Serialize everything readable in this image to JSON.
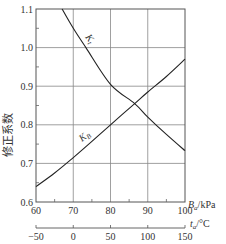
{
  "chart_data": {
    "type": "line",
    "title": "",
    "xlabel": "B_a/kPa",
    "xlabel_main": "B",
    "xlabel_sub": "a",
    "xlabel_unit": "/kPa",
    "ylabel": "修正系数",
    "xlim": [
      60,
      100
    ],
    "ylim": [
      0.6,
      1.1
    ],
    "x_ticks": [
      60,
      70,
      80,
      90,
      100
    ],
    "x_minor_ticks": [
      65,
      75,
      85,
      95
    ],
    "y_ticks": [
      0.6,
      0.7,
      0.8,
      0.9,
      1.0,
      1.1
    ],
    "y_tick_labels": [
      "0.6",
      "0.7",
      "0.8",
      "0.9",
      "1.0",
      "1.1"
    ],
    "y_minor_ticks": [
      0.65,
      0.75,
      0.85,
      0.95,
      1.05
    ],
    "grid": true,
    "secondary_x_axis": {
      "label": "t_a/°C",
      "label_main": "t",
      "label_sub": "a",
      "label_unit": "/°C",
      "range": [
        -50,
        150
      ],
      "ticks": [
        -50,
        0,
        50,
        100,
        150
      ],
      "tick_labels": [
        "−50",
        "0",
        "50",
        "100",
        "150"
      ]
    },
    "series": [
      {
        "name": "K_t",
        "label_main": "K",
        "label_sub": "t",
        "x_axis": "t_a (°C), drawn against B_a scale",
        "x": [
          67,
          70,
          73.4,
          80,
          86.5,
          90,
          95,
          100
        ],
        "values": [
          1.1,
          1.05,
          1.0,
          0.905,
          0.855,
          0.82,
          0.775,
          0.733
        ]
      },
      {
        "name": "K_B",
        "label_main": "K",
        "label_sub": "B",
        "x_axis": "B_a (kPa)",
        "x": [
          60,
          65,
          70,
          75,
          80,
          86.5,
          90,
          95,
          100
        ],
        "values": [
          0.64,
          0.675,
          0.715,
          0.757,
          0.8,
          0.855,
          0.885,
          0.925,
          0.97
        ]
      }
    ],
    "intersection": {
      "x": 86.5,
      "y": 0.855
    }
  }
}
